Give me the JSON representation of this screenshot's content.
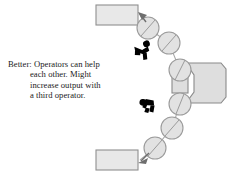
{
  "figure": {
    "kind": "process-flow-diagram",
    "background_color": "#ffffff",
    "caption": {
      "full_text": "Better: Operators can help each other. Might increase output with a third operator.",
      "lines": [
        "Better: Operators can help",
        "each other. Might",
        "increase output with",
        "a third operator."
      ],
      "text_color": "#1a1a1a"
    },
    "palette": {
      "shape_fill": "#e3e3e3",
      "shape_stroke": "#8a8a8a",
      "circle_fill": "#e0e0e0",
      "circle_stroke": "#9b9b9b",
      "belt_stroke": "#a8a8a8",
      "operator_fill": "#000000",
      "arrow_fill": "#6e6e6e"
    },
    "boxes": [
      {
        "label": "",
        "name": "output-box-top",
        "x": 96,
        "y": 5,
        "w": 42,
        "h": 20
      },
      {
        "label": "",
        "name": "output-box-bottom",
        "x": 96,
        "y": 150,
        "w": 42,
        "h": 20
      }
    ],
    "machine": {
      "label": "",
      "name": "machine-station",
      "x": 172,
      "y": 63,
      "w": 54,
      "h": 40
    },
    "rollers": [
      {
        "name": "roller-1",
        "cx": 148,
        "cy": 28,
        "r": 11
      },
      {
        "name": "roller-2",
        "cx": 169,
        "cy": 43,
        "r": 11
      },
      {
        "name": "roller-3",
        "cx": 180,
        "cy": 70,
        "r": 11
      },
      {
        "name": "roller-4",
        "cx": 180,
        "cy": 104,
        "r": 11
      },
      {
        "name": "roller-5",
        "cx": 172,
        "cy": 128,
        "r": 11
      },
      {
        "name": "roller-6",
        "cx": 155,
        "cy": 148,
        "r": 11
      }
    ],
    "operators": [
      {
        "name": "operator-upper",
        "x": 130,
        "y": 45,
        "rotation": -20
      },
      {
        "name": "operator-lower",
        "x": 140,
        "y": 96,
        "rotation": 8
      }
    ],
    "arrows": [
      {
        "name": "arrow-to-top-box",
        "from_x": 145,
        "from_y": 24,
        "to_x": 139,
        "to_y": 13
      },
      {
        "name": "arrow-to-bottom-box",
        "from_x": 150,
        "from_y": 152,
        "to_x": 139,
        "to_y": 161
      }
    ]
  }
}
